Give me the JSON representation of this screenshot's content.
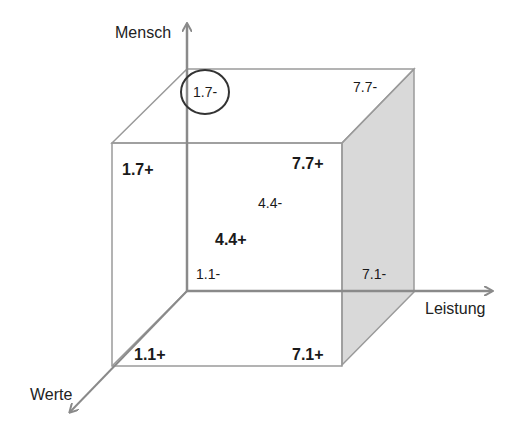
{
  "diagram": {
    "type": "3d-cube-matrix",
    "axes": {
      "vertical": "Mensch",
      "horizontal": "Leistung",
      "depth": "Werte"
    },
    "colors": {
      "edge": "#9a9a9a",
      "axis": "#8a8a8a",
      "shaded_face": "#d9d9d9",
      "highlight_circle": "#333333",
      "text": "#1a1a1a"
    },
    "cells": {
      "back_top_left": "1.7-",
      "back_top_right": "7.7-",
      "front_top_left": "1.7+",
      "front_top_right": "7.7+",
      "center_back": "4.4-",
      "center_front": "4.4+",
      "back_bottom_left": "1.1-",
      "back_bottom_right": "7.1-",
      "front_bottom_left": "1.1+",
      "front_bottom_right": "7.1+"
    },
    "highlighted_cell": "1.7-"
  }
}
